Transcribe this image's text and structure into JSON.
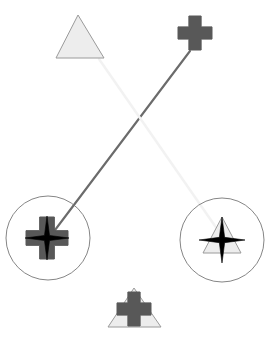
{
  "canvas": {
    "width": 269,
    "height": 337,
    "background": "#ffffff",
    "title": "abstract-shape-scene"
  },
  "palette": {
    "light_gray_fill": "#ededed",
    "light_gray_stroke": "#9a9a9a",
    "dark_gray_fill": "#585858",
    "dark_gray_stroke": "#585858",
    "black": "#000000",
    "circle_stroke": "#777777",
    "dark_edge": "#6b6b6b",
    "light_edge": "#f2f2f2"
  },
  "nodes": [
    {
      "id": "node-triangle-top-left",
      "name": "triangle-top-left",
      "shape": "triangle",
      "fill": "#ededed",
      "stroke": "#9a9a9a",
      "cx": 80,
      "cy": 43,
      "points": "78,15 56,58 104,58",
      "has_circle": false,
      "label": "light triangle"
    },
    {
      "id": "node-cross-top-right",
      "name": "cross-top-right",
      "shape": "cross",
      "fill": "#585858",
      "stroke": "#585858",
      "cx": 195,
      "cy": 33,
      "size": 34,
      "arm": 0.36,
      "has_circle": false,
      "label": "dark cross"
    },
    {
      "id": "node-cross-star-bottom-left",
      "name": "cross-star-bottom-left",
      "shape": "cross+star",
      "fill": "#585858",
      "stroke": "#585858",
      "overlay": "star",
      "overlay_fill": "#000000",
      "cx": 47,
      "cy": 238,
      "size": 42,
      "arm": 0.35,
      "star_r": 22,
      "star_inner": 0.16,
      "has_circle": true,
      "circle_r": 42,
      "label": "dark cross with black star"
    },
    {
      "id": "node-triangle-star-bottom-right",
      "name": "triangle-star-bottom-right",
      "shape": "triangle+star",
      "fill": "#ededed",
      "stroke": "#9a9a9a",
      "overlay": "star",
      "overlay_fill": "#000000",
      "cx": 222,
      "cy": 240,
      "points": "222,217 203,253 241,253",
      "star_r": 23,
      "star_inner": 0.16,
      "has_circle": true,
      "circle_r": 42,
      "label": "light triangle with black star"
    },
    {
      "id": "node-triangle-cross-bottom-center",
      "name": "triangle-cross-bottom-center",
      "shape": "triangle+cross",
      "fill": "#ededed",
      "stroke": "#9a9a9a",
      "overlay": "cross",
      "overlay_fill": "#585858",
      "cx": 134,
      "cy": 310,
      "points": "134,288 108,327 161,327",
      "cross_size": 34,
      "cross_arm": 0.36,
      "has_circle": false,
      "label": "light triangle with dark cross"
    }
  ],
  "edges": [
    {
      "id": "edge-dark",
      "name": "edge-cross-to-cross",
      "from": "node-cross-top-right",
      "to": "node-cross-star-bottom-left",
      "x1": 190,
      "y1": 51,
      "x2": 49,
      "y2": 238,
      "stroke": "#6b6b6b",
      "width": 2.1,
      "style": "solid"
    },
    {
      "id": "edge-light",
      "name": "edge-triangle-to-star",
      "from": "node-triangle-top-left",
      "to": "node-triangle-star-bottom-right",
      "x1": 99,
      "y1": 59,
      "x2": 222,
      "y2": 236,
      "stroke": "#f2f2f2",
      "width": 2.4,
      "style": "solid"
    }
  ]
}
